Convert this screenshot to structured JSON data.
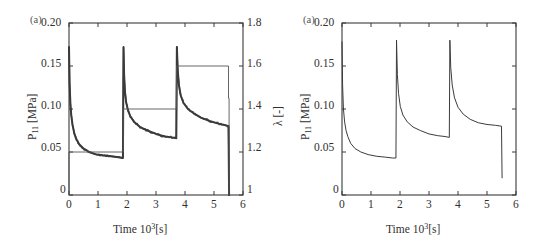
{
  "figure": {
    "caption_tag_left": "(a)",
    "caption_tag_right": "(a)"
  },
  "panels": [
    {
      "id": "left",
      "tag": "(a)",
      "y_left_title_main": "P",
      "y_left_title_sub": "11",
      "y_left_title_unit": " [MPa]",
      "y_right_title": "λ [-]",
      "x_title_main": "Time 10",
      "x_title_sup": "3",
      "x_title_unit": "[s]",
      "y_left_ticks": [
        "0",
        "0.05",
        "0.10",
        "0.15",
        "0.20"
      ],
      "y_right_ticks": [
        "1",
        "1.2",
        "1.4",
        "1.6",
        "1.8"
      ],
      "x_ticks": [
        "0",
        "1",
        "2",
        "3",
        "4",
        "5",
        "6"
      ]
    },
    {
      "id": "right",
      "tag": "(a)",
      "y_left_title_main": "P",
      "y_left_title_sub": "11",
      "y_left_title_unit": " [MPa]",
      "x_title_main": "Time 10",
      "x_title_sup": "3",
      "x_title_unit": "[s]",
      "y_left_ticks": [
        "0",
        "0.05",
        "0.10",
        "0.15",
        "0.20"
      ],
      "x_ticks": [
        "0",
        "1",
        "2",
        "3",
        "4",
        "5",
        "6"
      ]
    }
  ],
  "chart_data": [
    {
      "type": "line",
      "panel": "left",
      "title": "(a)",
      "xlabel": "Time 10^3 [s]",
      "ylabel": "P_11 [MPa]",
      "y2label": "lambda [-]",
      "xlim": [
        0,
        6
      ],
      "ylim": [
        0,
        0.2
      ],
      "y2lim": [
        1,
        1.8
      ],
      "grid": false,
      "legend": "none",
      "xticks": [
        0,
        1,
        2,
        3,
        4,
        5,
        6
      ],
      "yticks": [
        0,
        0.05,
        0.1,
        0.15,
        0.2
      ],
      "y2ticks": [
        1,
        1.2,
        1.4,
        1.6,
        1.8
      ],
      "series": [
        {
          "name": "P11 experimental (noisy)",
          "axis": "left",
          "style": "thick-noisy",
          "color": "#3b3b3b",
          "x": [
            0.0,
            0.02,
            0.05,
            0.08,
            0.12,
            0.18,
            0.25,
            0.35,
            0.5,
            0.7,
            0.95,
            1.2,
            1.45,
            1.7,
            1.86,
            1.88,
            1.9,
            1.93,
            1.97,
            2.03,
            2.12,
            2.25,
            2.45,
            2.7,
            3.0,
            3.3,
            3.55,
            3.7,
            3.72,
            3.75,
            3.79,
            3.85,
            3.95,
            4.1,
            4.3,
            4.55,
            4.85,
            5.15,
            5.4,
            5.5,
            5.52
          ],
          "y": [
            0.172,
            0.13,
            0.105,
            0.092,
            0.082,
            0.072,
            0.065,
            0.059,
            0.054,
            0.05,
            0.047,
            0.046,
            0.045,
            0.044,
            0.043,
            0.172,
            0.14,
            0.12,
            0.108,
            0.099,
            0.091,
            0.085,
            0.079,
            0.075,
            0.071,
            0.068,
            0.067,
            0.066,
            0.172,
            0.145,
            0.128,
            0.116,
            0.107,
            0.1,
            0.095,
            0.09,
            0.086,
            0.083,
            0.081,
            0.08,
            0.0
          ]
        },
        {
          "name": "lambda staircase",
          "axis": "right",
          "style": "thin-step",
          "color": "#555555",
          "steps": [
            {
              "x_start": 0.0,
              "x_end": 1.87,
              "lambda": 1.2
            },
            {
              "x_start": 1.87,
              "x_end": 3.71,
              "lambda": 1.4
            },
            {
              "x_start": 3.71,
              "x_end": 5.5,
              "lambda": 1.6
            },
            {
              "x_start": 5.5,
              "x_end": 5.52,
              "lambda": 1.45
            }
          ]
        }
      ],
      "annotations": [
        {
          "text": "stress relaxation after each stretch step",
          "visible": false
        }
      ]
    },
    {
      "type": "line",
      "panel": "right",
      "title": "(a)",
      "xlabel": "Time 10^3 [s]",
      "ylabel": "P_11 [MPa]",
      "xlim": [
        0,
        6
      ],
      "ylim": [
        0,
        0.2
      ],
      "grid": false,
      "legend": "none",
      "xticks": [
        0,
        1,
        2,
        3,
        4,
        5,
        6
      ],
      "yticks": [
        0,
        0.05,
        0.1,
        0.15,
        0.2
      ],
      "series": [
        {
          "name": "P11 model (smooth)",
          "axis": "left",
          "style": "thin-smooth",
          "color": "#3b3b3b",
          "x": [
            0.0,
            0.02,
            0.05,
            0.09,
            0.14,
            0.2,
            0.3,
            0.45,
            0.65,
            0.9,
            1.2,
            1.5,
            1.75,
            1.86,
            1.88,
            1.91,
            1.95,
            2.01,
            2.1,
            2.25,
            2.45,
            2.7,
            3.0,
            3.3,
            3.55,
            3.7,
            3.72,
            3.75,
            3.8,
            3.88,
            4.0,
            4.18,
            4.42,
            4.7,
            5.0,
            5.3,
            5.5,
            5.52
          ],
          "y": [
            0.178,
            0.128,
            0.1,
            0.085,
            0.075,
            0.068,
            0.06,
            0.054,
            0.05,
            0.047,
            0.045,
            0.044,
            0.043,
            0.043,
            0.18,
            0.14,
            0.118,
            0.103,
            0.093,
            0.085,
            0.079,
            0.075,
            0.071,
            0.069,
            0.068,
            0.067,
            0.18,
            0.148,
            0.128,
            0.113,
            0.102,
            0.094,
            0.088,
            0.084,
            0.082,
            0.081,
            0.08,
            0.02
          ]
        }
      ]
    }
  ]
}
